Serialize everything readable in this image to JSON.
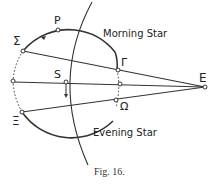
{
  "figure": {
    "caption": "Fig. 16.",
    "labels": {
      "P": "P",
      "Sigma": "Σ",
      "Gamma": "Γ",
      "S": "S",
      "E": "E",
      "Xi": "Ξ",
      "Omega": "Ω",
      "morning": "Morning Star",
      "evening": "Evening Star"
    }
  }
}
